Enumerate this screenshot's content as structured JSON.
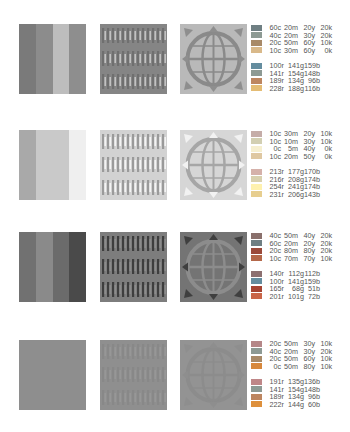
{
  "groups": [
    {
      "stripes": [
        "#7a7a7a",
        "#8c8c8c",
        "#bdbdbd",
        "#8e8e8e"
      ],
      "weave": {
        "base": "#858585",
        "bar": "#6f6f6f",
        "light": "#c2c2c2"
      },
      "globe": {
        "bg": "#b9b9b9",
        "ring": "#8a8a8a",
        "arrow": "#8e8e8e"
      },
      "cmyk": [
        {
          "chip": "#6f7f83",
          "c": "60c",
          "m": "20m",
          "y": "20y",
          "k": "20k"
        },
        {
          "chip": "#8d9a94",
          "c": "40c",
          "m": "20m",
          "y": "30y",
          "k": "20k"
        },
        {
          "chip": "#a88a68",
          "c": "20c",
          "m": "50m",
          "y": "60y",
          "k": "10k"
        },
        {
          "chip": "#d9b98a",
          "c": "10c",
          "m": "30m",
          "y": "60y",
          "k": "0k"
        }
      ],
      "rgb": [
        {
          "chip": "#648d9f",
          "r": "100r",
          "g": "141g",
          "b": "159b"
        },
        {
          "chip": "#8d9a94",
          "r": "141r",
          "g": "154g",
          "b": "148b"
        },
        {
          "chip": "#bd8660",
          "r": "189r",
          "g": "134g",
          "b": "96b"
        },
        {
          "chip": "#e4bc74",
          "r": "228r",
          "g": "188g",
          "b": "116b"
        }
      ]
    },
    {
      "stripes": [
        "#a9a9a9",
        "#c9c9c9",
        "#c9c9c9",
        "#efefef"
      ],
      "weave": {
        "base": "#d2d2d2",
        "bar": "#9a9a9a",
        "light": "#f4f4f4"
      },
      "globe": {
        "bg": "#d6d6d6",
        "ring": "#a6a6a6",
        "arrow": "#f2f2f2"
      },
      "cmyk": [
        {
          "chip": "#c5ada8",
          "c": "10c",
          "m": "30m",
          "y": "20y",
          "k": "10k"
        },
        {
          "chip": "#d2cfb2",
          "c": "10c",
          "m": "10m",
          "y": "30y",
          "k": "10k"
        },
        {
          "chip": "#f6efd0",
          "c": "0c",
          "m": "5m",
          "y": "40y",
          "k": "0k"
        },
        {
          "chip": "#dfc8a2",
          "c": "10c",
          "m": "20m",
          "y": "50y",
          "k": "0k"
        }
      ],
      "rgb": [
        {
          "chip": "#d5b1aa",
          "r": "213r",
          "g": "177g",
          "b": "170b"
        },
        {
          "chip": "#d8d0ae",
          "r": "216r",
          "g": "208g",
          "b": "174b"
        },
        {
          "chip": "#fef1ae",
          "r": "254r",
          "g": "241g",
          "b": "174b"
        },
        {
          "chip": "#e7ce8f",
          "r": "231r",
          "g": "206g",
          "b": "143b"
        }
      ]
    },
    {
      "stripes": [
        "#717171",
        "#8a8a8a",
        "#6b6b6b",
        "#4a4a4a"
      ],
      "weave": {
        "base": "#7d7d7d",
        "bar": "#3e3e3e",
        "light": "#8c8c8c"
      },
      "globe": {
        "bg": "#747474",
        "ring": "#8c8c8c",
        "arrow": "#3f3f3f"
      },
      "cmyk": [
        {
          "chip": "#8a706c",
          "c": "40c",
          "m": "50m",
          "y": "40y",
          "k": "20k"
        },
        {
          "chip": "#6f7f83",
          "c": "60c",
          "m": "20m",
          "y": "20y",
          "k": "20k"
        },
        {
          "chip": "#9b4a3a",
          "c": "20c",
          "m": "80m",
          "y": "80y",
          "k": "20k"
        },
        {
          "chip": "#b4684a",
          "c": "10c",
          "m": "70m",
          "y": "70y",
          "k": "10k"
        }
      ],
      "rgb": [
        {
          "chip": "#8c7070",
          "r": "140r",
          "g": "112g",
          "b": "112b"
        },
        {
          "chip": "#648d9f",
          "r": "100r",
          "g": "141g",
          "b": "159b"
        },
        {
          "chip": "#a54433",
          "r": "165r",
          "g": "68g",
          "b": "51b"
        },
        {
          "chip": "#c96548",
          "r": "201r",
          "g": "101g",
          "b": "72b"
        }
      ]
    },
    {
      "stripes": [
        "#8e8e8e",
        "#8e8e8e",
        "#8e8e8e",
        "#8e8e8e"
      ],
      "weave": {
        "base": "#8f8f8f",
        "bar": "#888888",
        "light": "#979797"
      },
      "globe": {
        "bg": "#939393",
        "ring": "#8c8c8c",
        "arrow": "#8e8e8e"
      },
      "cmyk": [
        {
          "chip": "#b58788",
          "c": "20c",
          "m": "50m",
          "y": "30y",
          "k": "10k"
        },
        {
          "chip": "#8d9a94",
          "c": "40c",
          "m": "20m",
          "y": "30y",
          "k": "20k"
        },
        {
          "chip": "#a88a68",
          "c": "20c",
          "m": "50m",
          "y": "60y",
          "k": "10k"
        },
        {
          "chip": "#d7883c",
          "c": "0c",
          "m": "50m",
          "y": "80y",
          "k": "10k"
        }
      ],
      "rgb": [
        {
          "chip": "#bf8788",
          "r": "191r",
          "g": "135g",
          "b": "136b"
        },
        {
          "chip": "#8d9a94",
          "r": "141r",
          "g": "154g",
          "b": "148b"
        },
        {
          "chip": "#bd8660",
          "r": "189r",
          "g": "134g",
          "b": "96b"
        },
        {
          "chip": "#de903c",
          "r": "222r",
          "g": "144g",
          "b": "60b"
        }
      ]
    }
  ],
  "legend_text_color": "#555555"
}
